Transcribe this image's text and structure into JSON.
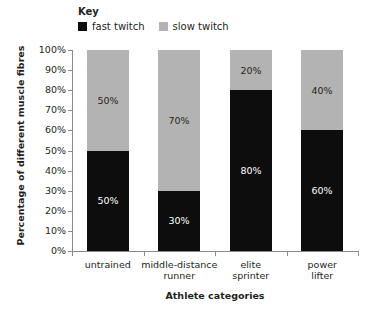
{
  "legend": {
    "title": "Key",
    "entries": [
      {
        "label": "fast twitch",
        "color": "#0d0d0d",
        "swatch": "legend-swatch-fast-twitch"
      },
      {
        "label": "slow twitch",
        "color": "#b3b3b3",
        "swatch": "legend-swatch-slow-twitch"
      }
    ]
  },
  "axes": {
    "y_title": "Percentage of different muscle fibres",
    "x_title": "Athlete categories",
    "y_ticks": [
      "0%",
      "10%",
      "20%",
      "30%",
      "40%",
      "50%",
      "60%",
      "70%",
      "80%",
      "90%",
      "100%"
    ]
  },
  "chart_data": {
    "type": "bar",
    "title": "",
    "subtitle": "",
    "stacked": true,
    "xlabel": "Athlete categories",
    "ylabel": "Percentage of different muscle fibres",
    "ylim": [
      0,
      100
    ],
    "ytick_step": 10,
    "ytick_labels": [
      "0%",
      "10%",
      "20%",
      "30%",
      "40%",
      "50%",
      "60%",
      "70%",
      "80%",
      "90%",
      "100%"
    ],
    "grid": false,
    "legend_position": "top-left",
    "categories": [
      "untrained",
      "middle-distance runner",
      "elite sprinter",
      "power lifter"
    ],
    "series": [
      {
        "name": "fast twitch",
        "color": "#0d0d0d",
        "values": [
          50,
          30,
          80,
          60
        ],
        "data_labels": [
          "50%",
          "30%",
          "80%",
          "60%"
        ]
      },
      {
        "name": "slow twitch",
        "color": "#b3b3b3",
        "values": [
          50,
          70,
          20,
          40
        ],
        "data_labels": [
          "50%",
          "70%",
          "20%",
          "40%"
        ]
      }
    ]
  },
  "category_lines": [
    [
      "untrained"
    ],
    [
      "middle-distance",
      "runner"
    ],
    [
      "elite",
      "sprinter"
    ],
    [
      "power",
      "lifter"
    ]
  ]
}
